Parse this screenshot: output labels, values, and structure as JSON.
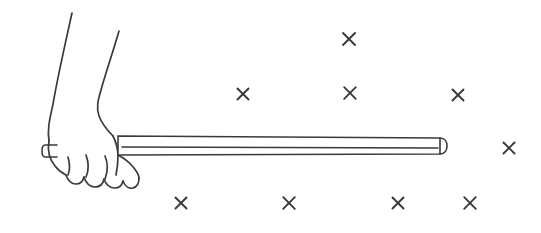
{
  "figure": {
    "background_color": "#ffffff",
    "ink_color": "#3a3a3e",
    "width": 541,
    "height": 233
  },
  "field": {
    "symbol": "x",
    "meaning": "magnetic field into the page",
    "marker_count": 9,
    "marker_half_size": 5.5,
    "markers": [
      {
        "id": "field-x-1",
        "x": 349,
        "y": 39,
        "size": 6.0
      },
      {
        "id": "field-x-2",
        "x": 243,
        "y": 94,
        "size": 5.5
      },
      {
        "id": "field-x-3",
        "x": 350,
        "y": 93,
        "size": 5.8
      },
      {
        "id": "field-x-4",
        "x": 458,
        "y": 95,
        "size": 5.5
      },
      {
        "id": "field-x-5",
        "x": 509,
        "y": 148,
        "size": 5.5
      },
      {
        "id": "field-x-6",
        "x": 181,
        "y": 203,
        "size": 5.5
      },
      {
        "id": "field-x-7",
        "x": 289,
        "y": 203,
        "size": 5.8
      },
      {
        "id": "field-x-8",
        "x": 398,
        "y": 203,
        "size": 5.5
      },
      {
        "id": "field-x-9",
        "x": 470,
        "y": 203,
        "size": 5.8
      }
    ]
  },
  "rod": {
    "label": "conducting rod",
    "left_x": 118,
    "right_x": 440,
    "top_y": 136,
    "bottom_y": 155,
    "cap_center_x": 443,
    "cap_rx": 4,
    "cap_ry": 9.5,
    "body_path": "M 118 136 L 440 138 L 440 154 L 118 155 Z",
    "inner_line_path": "M 122 147 L 438 148",
    "cap_path": "M 440 138 C 445 138 447 142 447 146 C 447 150 445 154 440 154"
  },
  "rod_stub": {
    "label": "rod end protruding left of fist",
    "path": "M 57 145 L 45 145 C 41 145 41 157 45 157 L 57 157"
  },
  "arm": {
    "label": "forearm",
    "outer_path": "M 72 13 C 66 40 58 75 53 104 C 50 118 47 129 49 141",
    "inner_path": "M 119 31 C 113 52 106 72 101 90 C 98 100 96 108 99 116 C 102 124 108 131 113 136"
  },
  "hand": {
    "label": "fist gripping the rod",
    "outline_path": "M 49 141 C 47 152 50 160 55 166 C 58 170 62 173 66 175",
    "knuckle_path": "M 66 175 C 68 181 72 184 76 184 C 80 184 83 181 84 177",
    "finger_2_path": "M 84 177 C 86 183 90 187 95 187 C 100 187 103 184 104 179",
    "finger_3_path": "M 104 179 C 106 185 110 188 115 188 C 119 188 122 185 123 181",
    "finger_4_path": "M 123 181 C 125 186 129 189 133 188 C 137 187 139 183 139 178",
    "thumb_path": "M 113 136 C 116 142 118 150 118 156 C 118 163 117 170 116 175",
    "grip_edge_path": "M 118 155 C 124 158 130 163 134 168 C 137 172 139 176 139 178",
    "knuckle_crease_1": "M 68 157 C 70 164 70 170 68 175",
    "knuckle_crease_2": "M 86 155 C 89 163 89 170 86 177",
    "knuckle_crease_3": "M 105 156 C 108 163 108 171 105 179",
    "wrist_edge_path": "M 113 136 L 118 136"
  },
  "annotations": {
    "caption": ""
  }
}
